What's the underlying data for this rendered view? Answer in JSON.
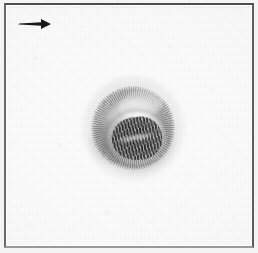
{
  "figure": {
    "kind": "electron-micrograph",
    "modality": "transmission electron microscopy",
    "color_mode": "grayscale",
    "width_px": 258,
    "height_px": 253,
    "caption_text": "",
    "scale_bar_label": ""
  },
  "frame": {
    "border_top_color": "#4e4e4e",
    "border_left_color": "#6a6a6a",
    "border_right_color": "#5c5c5c",
    "border_bottom_color": "#9a9a9a",
    "background_color": "#fbfbfb"
  },
  "annotations": [
    {
      "name": "orientation-arrow",
      "icon": "arrow-right-icon",
      "label": "",
      "direction": "right",
      "color": "#1a1a1a",
      "x_px": 12,
      "y_px": 12,
      "width_px": 34,
      "height_px": 14
    }
  ],
  "specimen": {
    "name": "virus-particle",
    "description": "roughly circular enveloped particle with coiled nucleocapsid core",
    "center_x_px": 127,
    "center_y_px": 123,
    "diameter_px": 90,
    "envelope": {
      "name": "particle-envelope",
      "tone": "mid-gray",
      "color": "#6e6e6e",
      "texture": "fibrillar coiled filaments"
    },
    "core": {
      "name": "nucleocapsid-core",
      "tone": "dark-gray",
      "color": "#343434",
      "texture": "herringbone striations",
      "width_px": 50,
      "height_px": 43
    },
    "halo": {
      "name": "particle-halo",
      "color": "#8c8c8c"
    }
  },
  "background": {
    "name": "micrograph-field",
    "base_color": "#fbfbfb",
    "grain": "fine film grain"
  }
}
